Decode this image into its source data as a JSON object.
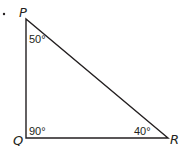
{
  "diagram": {
    "type": "right-triangle",
    "bullet": "•",
    "vertices": {
      "P": {
        "label": "P",
        "angle": "50°"
      },
      "Q": {
        "label": "Q",
        "angle": "90°"
      },
      "R": {
        "label": "R",
        "angle": "40°"
      }
    },
    "colors": {
      "stroke": "#231f20",
      "background": "#ffffff"
    }
  }
}
